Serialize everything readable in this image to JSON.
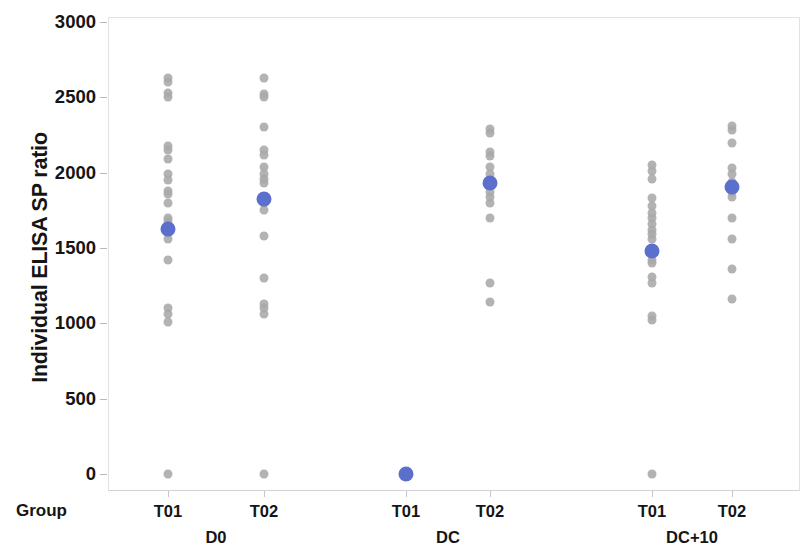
{
  "chart_data": {
    "type": "scatter",
    "title": "",
    "xlabel": "",
    "ylabel": "Individual ELISA SP ratio",
    "ylim": [
      0,
      3000
    ],
    "yticks": [
      0,
      500,
      1000,
      1500,
      2000,
      2500,
      3000
    ],
    "ytick_labels": [
      "0",
      "500",
      "1000",
      "1500",
      "2000",
      "2500",
      "3000"
    ],
    "grid": false,
    "legend": "none",
    "axis_row_label": "Group",
    "categories": [
      "T01",
      "T02",
      "T01",
      "T02",
      "T01",
      "T02"
    ],
    "group_labels": [
      "D0",
      "DC",
      "DC+10"
    ],
    "marker_colors": {
      "individual": "#a9a9a9",
      "mean": "#5b70cc"
    },
    "columns": [
      {
        "group": "D0",
        "treatment": "T01",
        "mean": 1628,
        "values": [
          2630,
          2600,
          2530,
          2500,
          2180,
          2150,
          2090,
          1990,
          1950,
          1880,
          1860,
          1800,
          1700,
          1680,
          1600,
          1560,
          1420,
          1100,
          1060,
          1010,
          0
        ]
      },
      {
        "group": "D0",
        "treatment": "T02",
        "mean": 1822,
        "values": [
          2630,
          2520,
          2500,
          2300,
          2150,
          2120,
          2040,
          1990,
          1960,
          1930,
          1800,
          1750,
          1580,
          1300,
          1130,
          1100,
          1060,
          0
        ]
      },
      {
        "group": "DC",
        "treatment": "T01",
        "mean": 0,
        "values": [
          0,
          0,
          0,
          0,
          0,
          0,
          0,
          0,
          0,
          0,
          0,
          0,
          0,
          0,
          0,
          0,
          0,
          0
        ]
      },
      {
        "group": "DC",
        "treatment": "T02",
        "mean": 1930,
        "values": [
          2290,
          2260,
          2140,
          2110,
          2040,
          1990,
          1870,
          1840,
          1800,
          1700,
          1270,
          1140
        ]
      },
      {
        "group": "DC+10",
        "treatment": "T01",
        "mean": 1480,
        "values": [
          2050,
          2010,
          1960,
          1830,
          1780,
          1730,
          1700,
          1660,
          1620,
          1590,
          1560,
          1420,
          1400,
          1310,
          1270,
          1050,
          1020,
          0
        ]
      },
      {
        "group": "DC+10",
        "treatment": "T02",
        "mean": 1905,
        "values": [
          2310,
          2280,
          2200,
          2030,
          1990,
          1940,
          1870,
          1840,
          1700,
          1560,
          1360,
          1160
        ]
      }
    ]
  }
}
